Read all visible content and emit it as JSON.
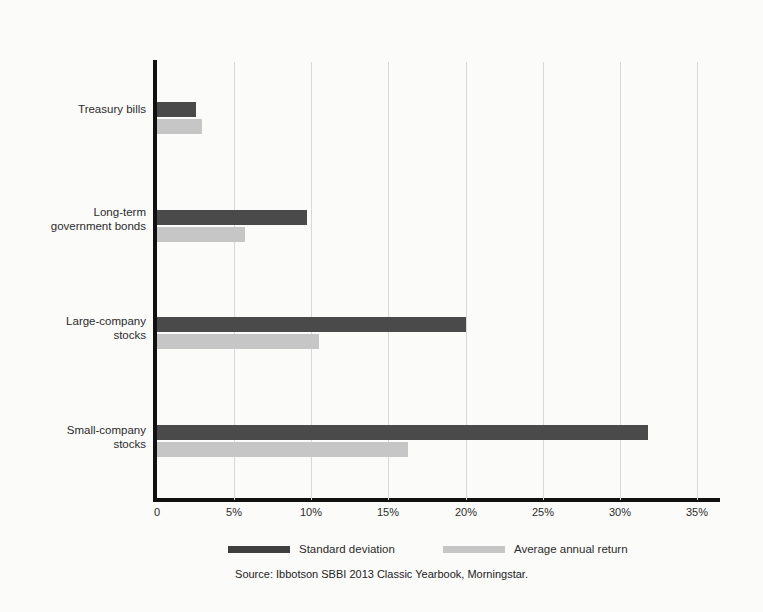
{
  "chart_data": {
    "type": "bar",
    "orientation": "horizontal",
    "title": "",
    "xlabel": "",
    "ylabel": "",
    "categories": [
      "Treasury bills",
      "Long-term\ngovernment bonds",
      "Large-company\nstocks",
      "Small-company\nstocks"
    ],
    "series": [
      {
        "name": "Standard deviation",
        "color": "#4a4a4a",
        "values": [
          2.5,
          9.7,
          20.0,
          31.8
        ]
      },
      {
        "name": "Average annual return",
        "color": "#c6c6c6",
        "values": [
          2.9,
          5.7,
          10.5,
          16.3
        ]
      }
    ],
    "xlim": [
      0,
      35
    ],
    "xtick_values": [
      0,
      5,
      10,
      15,
      20,
      25,
      30,
      35
    ],
    "xtick_labels": [
      "0",
      "5%",
      "10%",
      "15%",
      "20%",
      "25%",
      "30%",
      "35%"
    ],
    "grid": "vertical",
    "legend_position": "bottom"
  },
  "legend": {
    "items": [
      {
        "label": "Standard deviation",
        "swatch": "sd"
      },
      {
        "label": "Average annual return",
        "swatch": "ret"
      }
    ]
  },
  "source": {
    "text": "Source: Ibbotson SBBI 2013 Classic Yearbook, Morningstar."
  }
}
